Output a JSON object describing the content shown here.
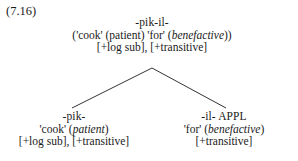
{
  "figure": {
    "example_number": "(7.16)",
    "type": "morphological-derivation-tree",
    "text_color": "#1a1a1a",
    "background_color": "#ffffff",
    "line_color": "#333333"
  },
  "tree": {
    "root": {
      "form": "-pik-il-",
      "gloss": "('cook' (patient) 'for' (benefactive))",
      "gloss_parts": [
        {
          "text": "('cook' (patient) 'for' (",
          "italic": false
        },
        {
          "text": "benefactive",
          "italic": true
        },
        {
          "text": "))",
          "italic": false
        }
      ],
      "features": "[+log sub], [+transitive]"
    },
    "left_daughter": {
      "form": "-pik-",
      "gloss": "'cook' (patient)",
      "gloss_parts": [
        {
          "text": "'cook' (",
          "italic": false
        },
        {
          "text": "patient",
          "italic": true
        },
        {
          "text": ")",
          "italic": false
        }
      ],
      "features": "[+log sub], [+transitive]"
    },
    "right_daughter": {
      "form": "-il- APPL",
      "gloss": "'for' (benefactive)",
      "gloss_parts": [
        {
          "text": "'for' (",
          "italic": false
        },
        {
          "text": "benefactive",
          "italic": true
        },
        {
          "text": ")",
          "italic": false
        }
      ],
      "features": "[+transitive]"
    }
  }
}
